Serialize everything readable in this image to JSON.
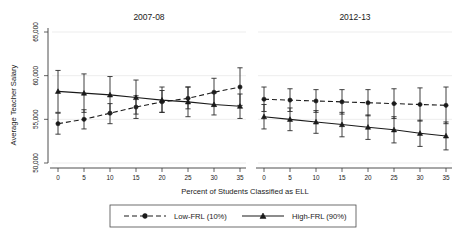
{
  "chart_data": {
    "type": "line",
    "title": "",
    "xlabel": "Percent of Students Classified as ELL",
    "ylabel": "Average Teacher Salary",
    "ylim": [
      50000,
      65000
    ],
    "yticks": [
      50000,
      55000,
      60000,
      65000
    ],
    "ytick_labels": [
      "50,000",
      "55,000",
      "60,000",
      "65,000"
    ],
    "xlim": [
      0,
      35
    ],
    "xticks": [
      0,
      5,
      10,
      15,
      20,
      25,
      30,
      35
    ],
    "xtick_labels": [
      "0",
      "5",
      "10",
      "15",
      "20",
      "25",
      "30",
      "35"
    ],
    "grid": true,
    "legend_position": "bottom",
    "error_bars": "95% CI",
    "panels": [
      {
        "title": "2007-08",
        "x": [
          0,
          5,
          10,
          15,
          20,
          25,
          30,
          35
        ],
        "series": [
          {
            "name": "Low-FRL (10%)",
            "marker": "circle",
            "line": "dashed",
            "values": [
              54500,
              55000,
              55700,
              56400,
              57000,
              57400,
              58100,
              58700
            ],
            "err_low": [
              53300,
              53900,
              54500,
              55100,
              55800,
              56200,
              56500,
              56600
            ],
            "err_high": [
              55700,
              56100,
              56800,
              57700,
              58300,
              58700,
              59700,
              60900
            ]
          },
          {
            "name": "High-FRL (90%)",
            "marker": "triangle",
            "line": "solid",
            "values": [
              58200,
              58000,
              57800,
              57500,
              57200,
              57000,
              56700,
              56500
            ],
            "err_low": [
              55800,
              55800,
              55700,
              55600,
              55800,
              55300,
              55500,
              55100
            ],
            "err_high": [
              60600,
              60200,
              59900,
              59500,
              58700,
              58700,
              58000,
              57900
            ]
          }
        ]
      },
      {
        "title": "2012-13",
        "x": [
          0,
          5,
          10,
          15,
          20,
          25,
          30,
          35
        ],
        "series": [
          {
            "name": "Low-FRL (10%)",
            "marker": "circle",
            "line": "dashed",
            "values": [
              57300,
              57200,
              57100,
              57000,
              56900,
              56800,
              56700,
              56600
            ],
            "err_low": [
              55900,
              55900,
              55800,
              55600,
              55400,
              55100,
              54800,
              54500
            ],
            "err_high": [
              58700,
              58500,
              58400,
              58400,
              58400,
              58500,
              58600,
              58700
            ]
          },
          {
            "name": "High-FRL (90%)",
            "marker": "triangle",
            "line": "solid",
            "values": [
              55300,
              55000,
              54700,
              54400,
              54100,
              53800,
              53400,
              53100
            ],
            "err_low": [
              53900,
              53700,
              53400,
              53000,
              52700,
              52300,
              51900,
              51500
            ],
            "err_high": [
              56700,
              56300,
              56000,
              55800,
              55500,
              55300,
              54900,
              54700
            ]
          }
        ]
      }
    ],
    "legend": [
      {
        "label": "Low-FRL (10%)",
        "marker": "circle",
        "line": "dashed"
      },
      {
        "label": "High-FRL (90%)",
        "marker": "triangle",
        "line": "solid"
      }
    ]
  }
}
